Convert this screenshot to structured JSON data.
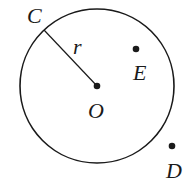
{
  "diagram": {
    "type": "geometry-circle",
    "colors": {
      "stroke": "#1a1a1a",
      "background": "#ffffff"
    },
    "circle": {
      "cx": 97,
      "cy": 86,
      "r": 77
    },
    "points": {
      "C": {
        "label": "C",
        "x": 44,
        "y": 30
      },
      "O": {
        "label": "O",
        "x": 97,
        "y": 86
      },
      "E": {
        "label": "E",
        "x": 136,
        "y": 49
      },
      "D": {
        "label": "D",
        "x": 172,
        "y": 146
      }
    },
    "segments": [
      {
        "from": "C",
        "to": "O",
        "label": "r"
      }
    ],
    "labels": {
      "C": "C",
      "O": "O",
      "E": "E",
      "D": "D",
      "r": "r"
    }
  }
}
